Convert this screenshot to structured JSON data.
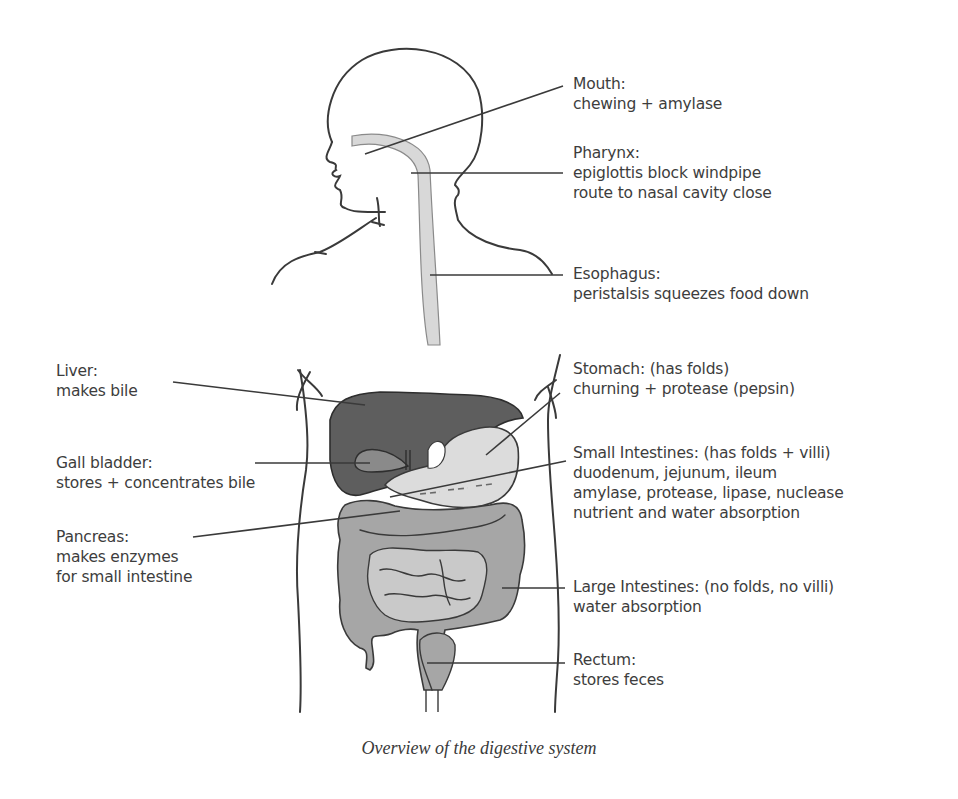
{
  "figure": {
    "caption": "Overview of the digestive system",
    "colors": {
      "outline": "#3a3a3a",
      "liver": "#5e5e5e",
      "gall_bladder": "#8a8a8a",
      "stomach": "#dcdcdc",
      "intestines": "#a6a6a6",
      "small_intestine": "#c9c9c9",
      "esophagus": "#d8d8d8",
      "background": "#ffffff"
    }
  },
  "labels": {
    "right": [
      {
        "id": "mouth",
        "title": "Mouth:",
        "lines": [
          "chewing + amylase"
        ]
      },
      {
        "id": "pharynx",
        "title": "Pharynx:",
        "lines": [
          "epiglottis block windpipe",
          "route to nasal cavity close"
        ]
      },
      {
        "id": "esophagus",
        "title": "Esophagus:",
        "lines": [
          "peristalsis squeezes food down"
        ]
      },
      {
        "id": "stomach",
        "title": "Stomach: (has folds)",
        "lines": [
          "churning + protease (pepsin)"
        ]
      },
      {
        "id": "small_intestines",
        "title": "Small Intestines: (has folds + villi)",
        "lines": [
          "duodenum, jejunum, ileum",
          "amylase, protease, lipase, nuclease",
          "nutrient and water absorption"
        ]
      },
      {
        "id": "large_intestines",
        "title": "Large Intestines: (no folds, no villi)",
        "lines": [
          "water absorption"
        ]
      },
      {
        "id": "rectum",
        "title": "Rectum:",
        "lines": [
          "stores feces"
        ]
      }
    ],
    "left": [
      {
        "id": "liver",
        "title": "Liver:",
        "lines": [
          "makes bile"
        ]
      },
      {
        "id": "gall_bladder",
        "title": "Gall bladder:",
        "lines": [
          "stores + concentrates bile"
        ]
      },
      {
        "id": "pancreas",
        "title": "Pancreas:",
        "lines": [
          "makes enzymes",
          "for small intestine"
        ]
      }
    ]
  }
}
